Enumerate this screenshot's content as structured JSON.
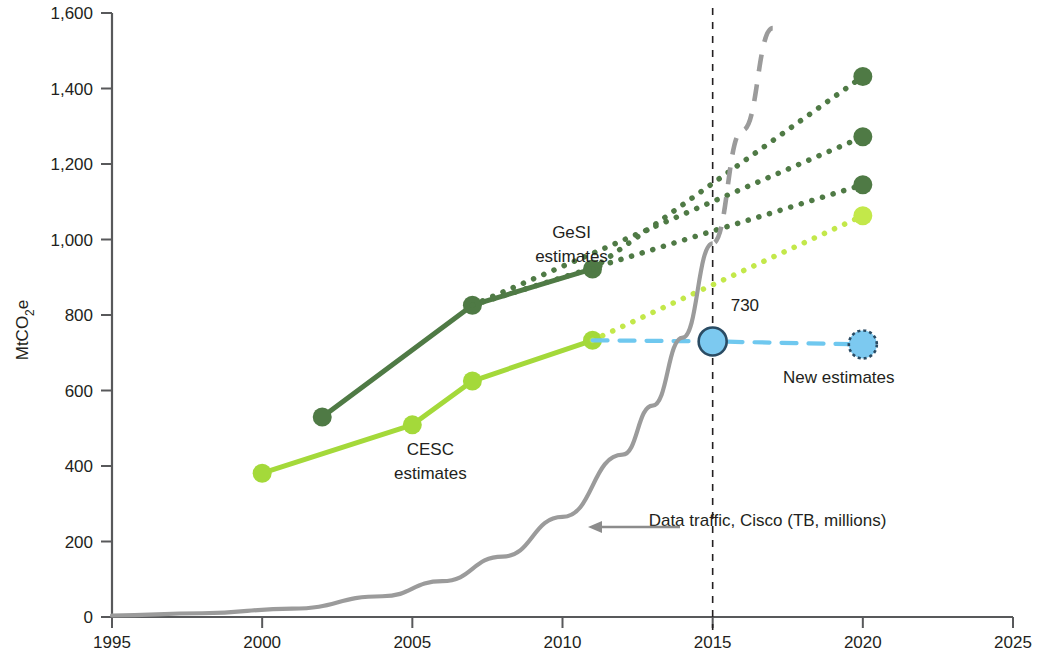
{
  "chart_data": {
    "type": "line",
    "title": "",
    "xlabel": "",
    "ylabel": "MtCO2e",
    "ylabel_parts": {
      "pre": "MtCO",
      "sub": "2",
      "post": "e"
    },
    "xlim": [
      1995,
      2025
    ],
    "ylim": [
      0,
      1600
    ],
    "grid": false,
    "legend_position": "inline-annotations",
    "x_ticks": [
      "1995",
      "2000",
      "2005",
      "2010",
      "2015",
      "2020",
      "2025"
    ],
    "x_tick_values": [
      1995,
      2000,
      2005,
      2010,
      2015,
      2020,
      2025
    ],
    "y_ticks": [
      "0",
      "200",
      "400",
      "600",
      "800",
      "1,000",
      "1,200",
      "1,400",
      "1,600"
    ],
    "y_tick_values": [
      0,
      200,
      400,
      600,
      800,
      1000,
      1200,
      1400,
      1600
    ],
    "series": [
      {
        "name": "GeSI estimates (historical)",
        "style": "solid",
        "color": "#4f7a45",
        "marker": "circle",
        "x": [
          2002,
          2007,
          2011
        ],
        "values": [
          530,
          826,
          922
        ]
      },
      {
        "name": "GeSI projection high",
        "style": "dotted",
        "color": "#4f7a45",
        "marker": "circle-end",
        "x": [
          2011,
          2020
        ],
        "values": [
          922,
          1432
        ]
      },
      {
        "name": "GeSI projection mid",
        "style": "dotted",
        "color": "#4f7a45",
        "marker": "circle-end",
        "x": [
          2007,
          2020
        ],
        "values": [
          826,
          1272
        ]
      },
      {
        "name": "GeSI projection low",
        "style": "dotted",
        "color": "#4f7a45",
        "marker": "circle-end",
        "x": [
          2007,
          2020
        ],
        "values": [
          826,
          1145
        ]
      },
      {
        "name": "CESC estimates (historical)",
        "style": "solid",
        "color": "#a4d93a",
        "marker": "circle",
        "x": [
          2000,
          2005,
          2007,
          2011
        ],
        "values": [
          381,
          509,
          625,
          733
        ]
      },
      {
        "name": "CESC projection",
        "style": "dotted",
        "color": "#c3e84a",
        "marker": "circle-end",
        "x": [
          2011,
          2015,
          2020
        ],
        "values": [
          733,
          880,
          1063
        ]
      },
      {
        "name": "New estimates",
        "style": "dashed",
        "color": "#6fc8ef",
        "marker": "ring",
        "x": [
          2011,
          2015,
          2020
        ],
        "values": [
          733,
          730,
          722
        ]
      },
      {
        "name": "Data traffic, Cisco (TB, millions)",
        "style": "solid-then-dashed",
        "color": "#9b9b9b",
        "marker": "none",
        "x": [
          1995,
          1998,
          2001,
          2004,
          2006,
          2008,
          2010,
          2012,
          2013,
          2014,
          2015,
          2016,
          2017
        ],
        "values": [
          4,
          10,
          22,
          55,
          95,
          160,
          265,
          430,
          560,
          740,
          990,
          1290,
          1560
        ]
      }
    ],
    "annotations": [
      {
        "id": "gesi-label",
        "text": "GeSI",
        "x": 2010.3,
        "y": 1005
      },
      {
        "id": "gesi-label-2",
        "text": "estimates",
        "x": 2010.3,
        "y": 940
      },
      {
        "id": "cesc-label",
        "text": "CESC",
        "x": 2005.6,
        "y": 430
      },
      {
        "id": "cesc-label-2",
        "text": "estimates",
        "x": 2005.6,
        "y": 365
      },
      {
        "id": "new-estimates-label",
        "text": "New estimates",
        "x": 2019.2,
        "y": 620
      },
      {
        "id": "value-730",
        "text": "730",
        "x": 2015.6,
        "y": 810
      },
      {
        "id": "cisco-label",
        "text": "Data traffic, Cisco (TB, millions)",
        "x": 2015.0,
        "y": 240
      }
    ],
    "vertical_marker": {
      "x": 2015,
      "style": "dashed",
      "color": "#231f20"
    }
  }
}
